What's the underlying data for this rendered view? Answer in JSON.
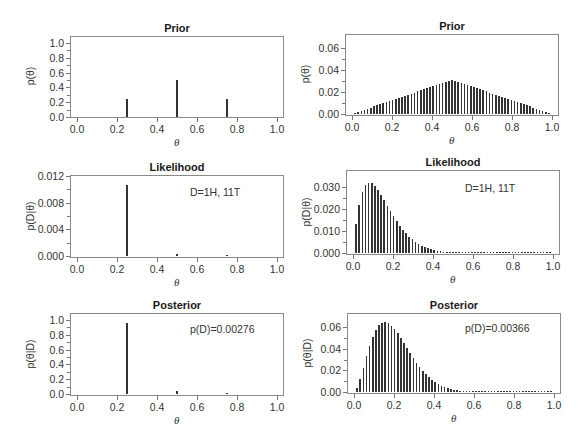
{
  "panels": [
    {
      "id": "prior-left",
      "title": "Prior",
      "ylabel": "p(θ)",
      "xlabel": "θ",
      "yticks": [
        "1.0",
        "0.8",
        "0.6",
        "0.4",
        "0.2",
        "0.0"
      ],
      "xticks": [
        "0.0",
        "0.2",
        "0.4",
        "0.6",
        "0.8",
        "1.0"
      ],
      "annotation": ""
    },
    {
      "id": "prior-right",
      "title": "Prior",
      "ylabel": "p(θ)",
      "xlabel": "θ",
      "yticks": [
        "0.06",
        "0.04",
        "0.02",
        "0.00"
      ],
      "xticks": [
        "0.0",
        "0.2",
        "0.4",
        "0.6",
        "0.8",
        "1.0"
      ],
      "annotation": ""
    },
    {
      "id": "likelihood-left",
      "title": "Likelihood",
      "ylabel": "p(D|θ)",
      "xlabel": "θ",
      "yticks": [
        "0.012",
        "0.008",
        "0.004",
        "0.000"
      ],
      "xticks": [
        "0.0",
        "0.2",
        "0.4",
        "0.6",
        "0.8",
        "1.0"
      ],
      "annotation": "D=1H, 11T"
    },
    {
      "id": "likelihood-right",
      "title": "Likelihood",
      "ylabel": "p(D|θ)",
      "xlabel": "θ",
      "yticks": [
        "0.030",
        "0.020",
        "0.010",
        "0.000"
      ],
      "xticks": [
        "0.0",
        "0.2",
        "0.4",
        "0.6",
        "0.8",
        "1.0"
      ],
      "annotation": "D=1H, 11T"
    },
    {
      "id": "posterior-left",
      "title": "Posterior",
      "ylabel": "p(θ|D)",
      "xlabel": "θ",
      "yticks": [
        "1.0",
        "0.8",
        "0.6",
        "0.4",
        "0.2",
        "0.0"
      ],
      "xticks": [
        "0.0",
        "0.2",
        "0.4",
        "0.6",
        "0.8",
        "1.0"
      ],
      "annotation": "p(D)=0.00276"
    },
    {
      "id": "posterior-right",
      "title": "Posterior",
      "ylabel": "p(θ|D)",
      "xlabel": "θ",
      "yticks": [
        "0.06",
        "0.04",
        "0.02",
        "0.00"
      ],
      "xticks": [
        "0.0",
        "0.2",
        "0.4",
        "0.6",
        "0.8",
        "1.0"
      ],
      "annotation": "p(D)=0.00366"
    }
  ],
  "chart_data": [
    {
      "type": "bar",
      "title": "Prior",
      "xlabel": "θ",
      "ylabel": "p(θ)",
      "xlim": [
        0,
        1
      ],
      "ylim": [
        0,
        1.0
      ],
      "x": [
        0.25,
        0.5,
        0.75
      ],
      "values": [
        0.25,
        0.5,
        0.25
      ]
    },
    {
      "type": "bar",
      "title": "Prior",
      "xlabel": "θ",
      "ylabel": "p(θ)",
      "xlim": [
        0,
        1
      ],
      "ylim": [
        0,
        0.07
      ],
      "x_grid": "63 equally spaced θ values from 1/64 to 63/64",
      "shape": "triangular, peak at θ=0.5",
      "peak_value": 0.031
    },
    {
      "type": "bar",
      "title": "Likelihood",
      "xlabel": "θ",
      "ylabel": "p(D|θ)",
      "xlim": [
        0,
        1
      ],
      "ylim": [
        0,
        0.012
      ],
      "annotation": "D=1H, 11T",
      "x": [
        0.25,
        0.5,
        0.75
      ],
      "values": [
        0.0106,
        0.00024,
        2e-07
      ]
    },
    {
      "type": "bar",
      "title": "Likelihood",
      "xlabel": "θ",
      "ylabel": "p(D|θ)",
      "xlim": [
        0,
        1
      ],
      "ylim": [
        0,
        0.034
      ],
      "annotation": "D=1H, 11T",
      "shape": "θ·(1−θ)^11, peak ≈0.031 at θ≈0.083",
      "peak_value": 0.031
    },
    {
      "type": "bar",
      "title": "Posterior",
      "xlabel": "θ",
      "ylabel": "p(θ|D)",
      "xlim": [
        0,
        1
      ],
      "ylim": [
        0,
        1.0
      ],
      "annotation": "p(D)=0.00276",
      "x": [
        0.25,
        0.5,
        0.75
      ],
      "values": [
        0.956,
        0.044,
        2e-05
      ]
    },
    {
      "type": "bar",
      "title": "Posterior",
      "xlabel": "θ",
      "ylabel": "p(θ|D)",
      "xlim": [
        0,
        1
      ],
      "ylim": [
        0,
        0.07
      ],
      "annotation": "p(D)=0.00366",
      "shape": "prior×likelihood normalized, peak ≈0.064 at θ≈0.16",
      "peak_value": 0.064
    }
  ]
}
